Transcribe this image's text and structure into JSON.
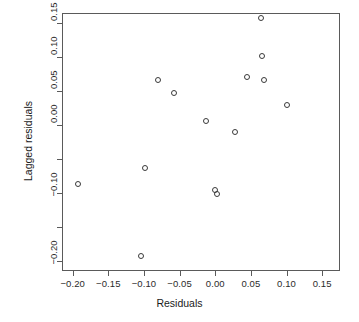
{
  "chart_data": {
    "type": "scatter",
    "title": "",
    "xlabel": "Residuals",
    "ylabel": "Lagged residuals",
    "xlim": [
      -0.215,
      0.175
    ],
    "ylim": [
      -0.215,
      0.165
    ],
    "grid": false,
    "legend": null,
    "marker": "open-circle",
    "xticks": [
      -0.2,
      -0.15,
      -0.1,
      -0.05,
      0.0,
      0.05,
      0.1,
      0.15
    ],
    "xticklabels": [
      "-0.20",
      "-0.15",
      "-0.10",
      "-0.05",
      "0.00",
      "0.05",
      "0.10",
      "0.15"
    ],
    "yticks": [
      0.15,
      0.1,
      0.05,
      0.0,
      -0.05,
      -0.1,
      -0.15,
      -0.2
    ],
    "yticklabels": [
      "0.15",
      "0.10",
      "0.05",
      "0.00",
      "",
      "-0.10",
      "",
      "-0.20"
    ],
    "points": [
      {
        "x": -0.193,
        "y": -0.087
      },
      {
        "x": -0.104,
        "y": -0.193
      },
      {
        "x": -0.098,
        "y": -0.063
      },
      {
        "x": -0.081,
        "y": 0.067
      },
      {
        "x": -0.058,
        "y": 0.047
      },
      {
        "x": -0.013,
        "y": 0.006
      },
      {
        "x": 0.0,
        "y": -0.095
      },
      {
        "x": 0.003,
        "y": -0.102
      },
      {
        "x": 0.028,
        "y": -0.01
      },
      {
        "x": 0.045,
        "y": 0.071
      },
      {
        "x": 0.064,
        "y": 0.158
      },
      {
        "x": 0.065,
        "y": 0.101
      },
      {
        "x": 0.068,
        "y": 0.066
      },
      {
        "x": 0.1,
        "y": 0.03
      }
    ]
  },
  "figure": {
    "background_color": "#ffffff",
    "frame_color": "#5a5a5a",
    "marker_color": "#3a3a3a"
  }
}
